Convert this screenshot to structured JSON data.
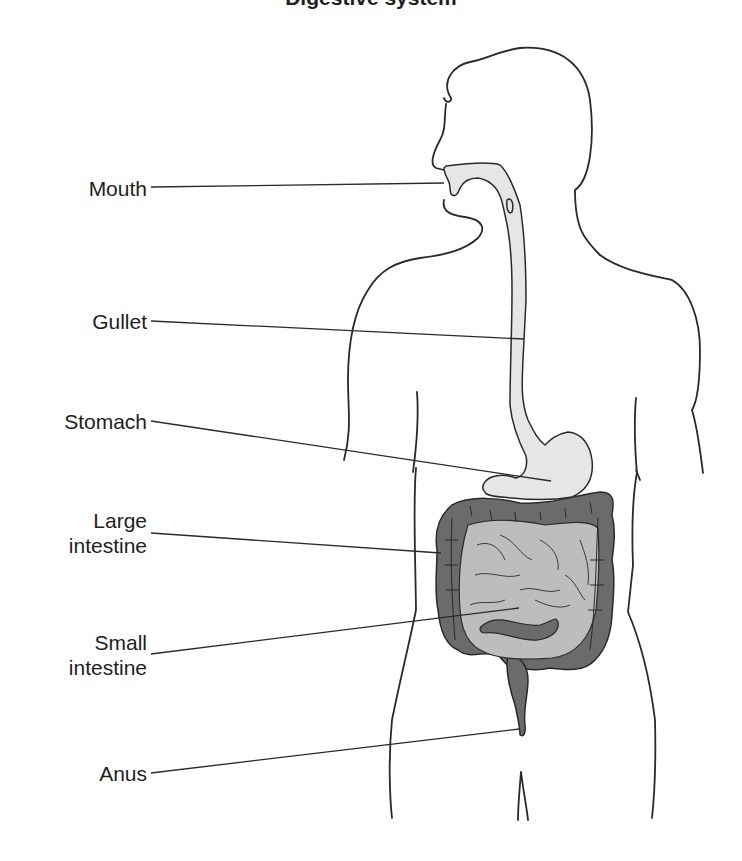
{
  "diagram": {
    "title_fragment": "Digestive system",
    "colors": {
      "outline": "#2a2a2a",
      "upper_tract_fill": "#e6e6e6",
      "small_intestine_fill": "#bdbdbd",
      "large_intestine_fill": "#6b6b6b",
      "leader_line": "#2a2a2a",
      "label_text": "#1e1e1e",
      "background": "#ffffff"
    },
    "labels": [
      {
        "id": "mouth",
        "lines": [
          "Mouth"
        ]
      },
      {
        "id": "gullet",
        "lines": [
          "Gullet"
        ]
      },
      {
        "id": "stomach",
        "lines": [
          "Stomach"
        ]
      },
      {
        "id": "large-intestine",
        "lines": [
          "Large",
          "intestine"
        ]
      },
      {
        "id": "small-intestine",
        "lines": [
          "Small",
          "intestine"
        ]
      },
      {
        "id": "anus",
        "lines": [
          "Anus"
        ]
      }
    ]
  }
}
